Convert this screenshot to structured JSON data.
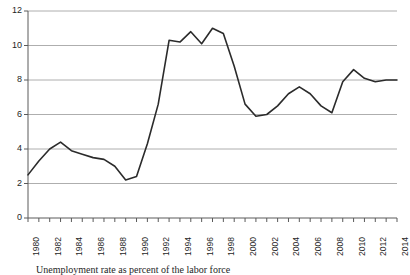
{
  "chart_data": {
    "type": "line",
    "title": "",
    "subtitle": "",
    "xlabel": "",
    "ylabel": "",
    "xlim": [
      1980,
      2014
    ],
    "ylim": [
      0,
      12
    ],
    "yticks": [
      0,
      2,
      4,
      6,
      8,
      10,
      12
    ],
    "ytick_labels": [
      "0",
      "2",
      "4",
      "6",
      "8",
      "10",
      "12"
    ],
    "xticks": [
      1980,
      1981,
      1982,
      1983,
      1984,
      1985,
      1986,
      1987,
      1988,
      1989,
      1990,
      1991,
      1992,
      1993,
      1994,
      1995,
      1996,
      1997,
      1998,
      1999,
      2000,
      2001,
      2002,
      2003,
      2004,
      2005,
      2006,
      2007,
      2008,
      2009,
      2010,
      2011,
      2012,
      2013,
      2014
    ],
    "xtick_labels": [
      "1980",
      "1982",
      "1984",
      "1986",
      "1988",
      "1990",
      "1992",
      "1994",
      "1996",
      "1998",
      "2000",
      "2002",
      "2004",
      "2006",
      "2008",
      "2010",
      "2012",
      "2014"
    ],
    "xtick_label_years": [
      1980,
      1982,
      1984,
      1986,
      1988,
      1990,
      1992,
      1994,
      1996,
      1998,
      2000,
      2002,
      2004,
      2006,
      2008,
      2010,
      2012,
      2014
    ],
    "grid": "horizontal",
    "legend": "none",
    "line_color": "#2b2b2b",
    "grid_color": "#aeaeae",
    "axis_color": "#5a5a5a",
    "background": "#ffffff",
    "x": [
      1980,
      1981,
      1982,
      1983,
      1984,
      1985,
      1986,
      1987,
      1988,
      1989,
      1990,
      1991,
      1992,
      1993,
      1994,
      1995,
      1996,
      1997,
      1998,
      1999,
      2000,
      2001,
      2002,
      2003,
      2004,
      2005,
      2006,
      2007,
      2008,
      2009,
      2010,
      2011,
      2012,
      2013,
      2014
    ],
    "series": [
      {
        "name": "Unemployment rate",
        "values": [
          2.5,
          3.3,
          4.0,
          4.4,
          3.9,
          3.7,
          3.5,
          3.4,
          3.0,
          2.2,
          2.4,
          4.3,
          6.6,
          10.3,
          10.2,
          10.8,
          10.1,
          11.0,
          10.7,
          8.8,
          6.6,
          5.9,
          6.0,
          6.5,
          7.2,
          7.6,
          7.2,
          6.5,
          6.1,
          7.9,
          8.6,
          8.1,
          7.9,
          8.0,
          8.0
        ]
      }
    ]
  },
  "caption": {
    "text": "Unemployment rate as percent of the labor force"
  }
}
